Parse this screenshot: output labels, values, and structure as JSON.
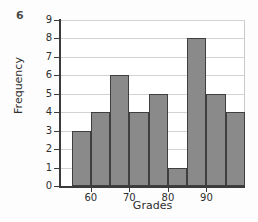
{
  "problem_number": "6",
  "chart_data": {
    "type": "bar",
    "title": "",
    "xlabel": "Grades",
    "ylabel": "Frequency",
    "categories": [
      "55-60",
      "60-65",
      "65-70",
      "70-75",
      "75-80",
      "80-85",
      "85-90",
      "90-95",
      "95-100"
    ],
    "bin_edges": [
      55,
      60,
      65,
      70,
      75,
      80,
      85,
      90,
      95,
      100
    ],
    "values": [
      3,
      4,
      6,
      4,
      5,
      1,
      8,
      5,
      4
    ],
    "xlim": [
      52,
      100
    ],
    "ylim": [
      0,
      9
    ],
    "y_ticks": [
      "0",
      "1",
      "2",
      "3",
      "4",
      "5",
      "6",
      "7",
      "8",
      "9"
    ],
    "x_ticks": [
      "60",
      "70",
      "80",
      "90"
    ],
    "x_tick_values": [
      60,
      70,
      80,
      90
    ],
    "grid": true,
    "legend": "none",
    "bar_color": "#8a8a8a",
    "bar_edge_color": "#3f3f3f",
    "axis_color": "#3b3b3b",
    "grid_color": "#d2d2d2",
    "background_color": "#ffffff"
  }
}
